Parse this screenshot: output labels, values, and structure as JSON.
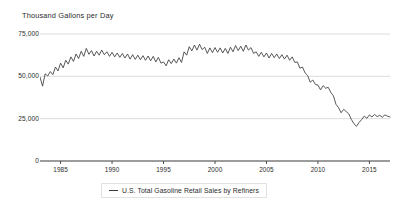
{
  "axis_title": "Thousand Gallons per Day",
  "legend": {
    "label": "U.S. Total Gasoline Retail Sales by Refiners",
    "marker": "line-marker-icon"
  },
  "chart_data": {
    "type": "line",
    "title": "",
    "subtitle": "",
    "xlabel": "",
    "ylabel": "Thousand Gallons per Day",
    "ylim": [
      0,
      75000
    ],
    "xlim": [
      1983.0,
      2017.0
    ],
    "grid": true,
    "legend_position": "bottom",
    "yticks": [
      0,
      25000,
      50000,
      75000
    ],
    "ytick_labels": [
      "0",
      "25,000",
      "50,000",
      "75,000"
    ],
    "xticks": [
      1985,
      1990,
      1995,
      2000,
      2005,
      2010,
      2015
    ],
    "xtick_labels": [
      "1985",
      "1990",
      "1995",
      "2000",
      "2005",
      "2010",
      "2015"
    ],
    "line_color": "#3b3b3b",
    "grid_color": "#d8d8d8",
    "series": [
      {
        "name": "U.S. Total Gasoline Retail Sales by Refiners",
        "x": [
          1983.0,
          1983.25,
          1983.5,
          1983.75,
          1984.0,
          1984.25,
          1984.5,
          1984.75,
          1985.0,
          1985.25,
          1985.5,
          1985.75,
          1986.0,
          1986.25,
          1986.5,
          1986.75,
          1987.0,
          1987.25,
          1987.5,
          1987.75,
          1988.0,
          1988.25,
          1988.5,
          1988.75,
          1989.0,
          1989.25,
          1989.5,
          1989.75,
          1990.0,
          1990.25,
          1990.5,
          1990.75,
          1991.0,
          1991.25,
          1991.5,
          1991.75,
          1992.0,
          1992.25,
          1992.5,
          1992.75,
          1993.0,
          1993.25,
          1993.5,
          1993.75,
          1994.0,
          1994.25,
          1994.5,
          1994.75,
          1995.0,
          1995.25,
          1995.5,
          1995.75,
          1996.0,
          1996.25,
          1996.5,
          1996.75,
          1997.0,
          1997.25,
          1997.5,
          1997.75,
          1998.0,
          1998.25,
          1998.5,
          1998.75,
          1999.0,
          1999.25,
          1999.5,
          1999.75,
          2000.0,
          2000.25,
          2000.5,
          2000.75,
          2001.0,
          2001.25,
          2001.5,
          2001.75,
          2002.0,
          2002.25,
          2002.5,
          2002.75,
          2003.0,
          2003.25,
          2003.5,
          2003.75,
          2004.0,
          2004.25,
          2004.5,
          2004.75,
          2005.0,
          2005.25,
          2005.5,
          2005.75,
          2006.0,
          2006.25,
          2006.5,
          2006.75,
          2007.0,
          2007.25,
          2007.5,
          2007.75,
          2008.0,
          2008.25,
          2008.5,
          2008.75,
          2009.0,
          2009.25,
          2009.5,
          2009.75,
          2010.0,
          2010.25,
          2010.5,
          2010.75,
          2011.0,
          2011.25,
          2011.5,
          2011.75,
          2012.0,
          2012.25,
          2012.5,
          2012.75,
          2013.0,
          2013.25,
          2013.5,
          2013.75,
          2014.0,
          2014.25,
          2014.5,
          2014.75,
          2015.0,
          2015.25,
          2015.5,
          2015.75,
          2016.0,
          2016.25,
          2016.5,
          2016.75,
          2017.0
        ],
        "values": [
          49500,
          44200,
          51500,
          50200,
          52800,
          51000,
          55500,
          53200,
          57800,
          55000,
          59500,
          57200,
          61500,
          58800,
          63200,
          60500,
          64800,
          61800,
          66500,
          63000,
          65200,
          62000,
          64800,
          62500,
          65500,
          62800,
          64500,
          61800,
          64200,
          61500,
          63800,
          61200,
          63500,
          60800,
          63200,
          60200,
          62800,
          60000,
          62500,
          59800,
          62200,
          59500,
          62000,
          59200,
          61800,
          58500,
          61200,
          57800,
          58500,
          56200,
          59800,
          57500,
          60200,
          57800,
          61000,
          58200,
          64500,
          62500,
          67500,
          65000,
          68500,
          65500,
          69000,
          65800,
          67200,
          63500,
          66800,
          64000,
          67000,
          64200,
          66800,
          63800,
          66500,
          63500,
          67200,
          64500,
          68200,
          65200,
          67800,
          64800,
          68500,
          65500,
          67000,
          63500,
          64500,
          61800,
          64200,
          61500,
          63800,
          60800,
          63500,
          61000,
          63200,
          60500,
          62800,
          60200,
          62500,
          59500,
          61500,
          58200,
          58500,
          54800,
          55500,
          52000,
          50500,
          46500,
          47800,
          45200,
          44800,
          42000,
          44500,
          43000,
          43500,
          40500,
          38500,
          33500,
          31500,
          28500,
          30500,
          29200,
          27800,
          24500,
          22000,
          20500,
          22800,
          24500,
          26500,
          25200,
          27200,
          26000,
          27500,
          26200,
          27000,
          25800,
          27200,
          26500,
          26000
        ]
      }
    ],
    "annotations": []
  }
}
